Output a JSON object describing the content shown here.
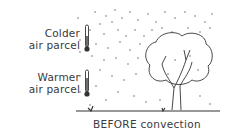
{
  "labels": {
    "colder_line1": "Colder",
    "colder_line2": "air parcel",
    "warmer_line1": "Warmer",
    "warmer_line2": "air parcel"
  },
  "caption": "BEFORE convection",
  "icons": [
    "thermometer-icon",
    "thermometer-icon",
    "tree-icon",
    "ground-line",
    "air-particles"
  ],
  "colors": {
    "ink": "#333333",
    "background": "#ffffff"
  }
}
